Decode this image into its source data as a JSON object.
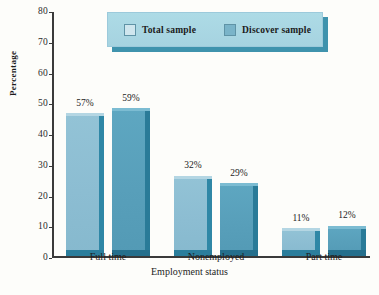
{
  "chart_data": {
    "type": "bar",
    "title": "",
    "subtitle": "",
    "xlabel": "Employment status",
    "ylabel": "Percentage",
    "ylim": [
      0,
      80
    ],
    "ytick_step": 10,
    "yticks": [
      "0",
      "10",
      "20",
      "30",
      "40",
      "50",
      "60",
      "70",
      "80"
    ],
    "categories": [
      "Full time",
      "Nonemployed",
      "Part time"
    ],
    "grid": false,
    "legend_position": "top-center",
    "series": [
      {
        "name": "Total sample",
        "color": "#8cbdd2",
        "values": [
          57,
          32,
          11
        ],
        "labels": [
          "57%",
          "32%",
          "11%"
        ]
      },
      {
        "name": "Discover sample",
        "color": "#589fba",
        "values": [
          59,
          29,
          12
        ],
        "labels": [
          "59%",
          "29%",
          "12%"
        ]
      }
    ]
  },
  "legend": {
    "items": [
      {
        "label": "Total sample",
        "swatch": "legend-swatch-total"
      },
      {
        "label": "Discover sample",
        "swatch": "legend-swatch-discover"
      }
    ]
  },
  "axes": {
    "y_title": "Percentage",
    "x_title": "Employment status"
  },
  "colors": {
    "background": "#fdfdfa",
    "axis": "#3a3a3a",
    "series_a_face": "#8cbdd2",
    "series_a_side": "#2f87a6",
    "series_b_face": "#589fba",
    "series_b_side": "#2a7b98",
    "legend_panel": "#a6d3e0",
    "legend_shadow": "#3f93ad"
  }
}
